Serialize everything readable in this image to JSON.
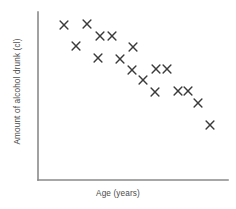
{
  "chart_data": {
    "type": "scatter",
    "title": "",
    "xlabel": "Age (years)",
    "ylabel": "Amount of alcohol drunk (cl)",
    "xlim": [
      0,
      100
    ],
    "ylim": [
      0,
      100
    ],
    "grid": false,
    "legend": null,
    "xticks": [],
    "yticks": [],
    "marker": "x",
    "marker_color": "#3b3b3b",
    "axis_color": "#8a8a8a",
    "background_color": "#ffffff",
    "n_points": 22,
    "points": [
      {
        "x": 16,
        "y": 94
      },
      {
        "x": 28,
        "y": 94
      },
      {
        "x": 22,
        "y": 82
      },
      {
        "x": 36,
        "y": 88
      },
      {
        "x": 42,
        "y": 88
      },
      {
        "x": 34,
        "y": 76
      },
      {
        "x": 44,
        "y": 76
      },
      {
        "x": 54,
        "y": 81
      },
      {
        "x": 51,
        "y": 70
      },
      {
        "x": 62,
        "y": 70
      },
      {
        "x": 68,
        "y": 70
      },
      {
        "x": 57,
        "y": 63
      },
      {
        "x": 63,
        "y": 56
      },
      {
        "x": 76,
        "y": 56
      },
      {
        "x": 81,
        "y": 56
      },
      {
        "x": 86,
        "y": 49
      },
      {
        "x": 93,
        "y": 35
      }
    ],
    "pixel_points": [
      {
        "px": 64,
        "py": 25
      },
      {
        "px": 87,
        "py": 24
      },
      {
        "px": 76,
        "py": 46
      },
      {
        "px": 100,
        "py": 36
      },
      {
        "px": 112,
        "py": 36
      },
      {
        "px": 98,
        "py": 58
      },
      {
        "px": 120,
        "py": 59
      },
      {
        "px": 133,
        "py": 47
      },
      {
        "px": 132,
        "py": 70
      },
      {
        "px": 156,
        "py": 69
      },
      {
        "px": 167,
        "py": 69
      },
      {
        "px": 143,
        "py": 80
      },
      {
        "px": 155,
        "py": 92
      },
      {
        "px": 178,
        "py": 91
      },
      {
        "px": 188,
        "py": 91
      },
      {
        "px": 198,
        "py": 103
      },
      {
        "px": 210,
        "py": 125
      }
    ]
  },
  "axes": {
    "origin_x": 38,
    "origin_y": 180,
    "x_end": 228,
    "y_top": 12
  }
}
